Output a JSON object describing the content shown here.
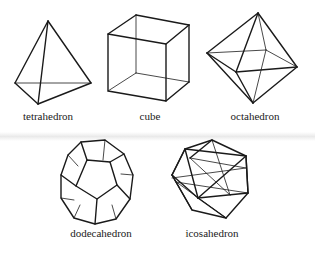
{
  "figure": {
    "solids": [
      {
        "id": "tetrahedron",
        "label": "tetrahedron",
        "faces": 4,
        "face_shape": "triangle"
      },
      {
        "id": "cube",
        "label": "cube",
        "faces": 6,
        "face_shape": "square"
      },
      {
        "id": "octahedron",
        "label": "octahedron",
        "faces": 8,
        "face_shape": "triangle"
      },
      {
        "id": "dodecahedron",
        "label": "dodecahedron",
        "faces": 12,
        "face_shape": "pentagon"
      },
      {
        "id": "icosahedron",
        "label": "icosahedron",
        "faces": 20,
        "face_shape": "triangle"
      }
    ],
    "colors": {
      "line": "#1a1a1a",
      "background": "#ffffff",
      "text": "#222222"
    }
  }
}
